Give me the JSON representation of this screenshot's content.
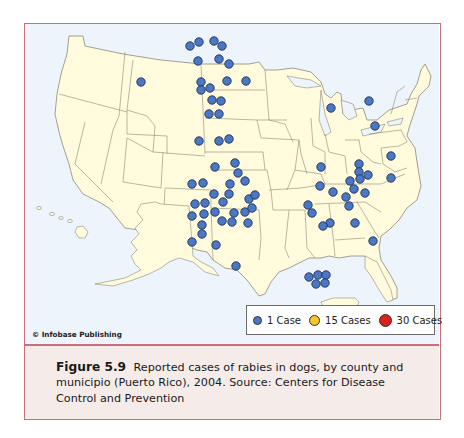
{
  "figure": {
    "label": "Figure 5.9",
    "caption": "Reported cases of rabies in dogs, by county and municipio (Puerto Rico), 2004. Source: Centers for Disease Control and Prevention"
  },
  "copyright": "© Infobase Publishing",
  "colors": {
    "frame": "#c9707a",
    "water": "#eef4fb",
    "land": "#fffbdc",
    "border": "#8a8a7a",
    "case_1": "#4a78c4",
    "case_15": "#f2c531",
    "case_30": "#d8231c",
    "caption_bg": "#f5ecea"
  },
  "legend": {
    "items": [
      {
        "label": "1 Case",
        "color": "#4a78c4",
        "size": "small"
      },
      {
        "label": "15 Cases",
        "color": "#f2c531",
        "size": "medium"
      },
      {
        "label": "30 Cases",
        "color": "#d8231c",
        "size": "large"
      }
    ]
  },
  "map": {
    "title": "Reported cases of rabies in dogs, 2004",
    "region": "United States incl. Alaska, Hawaii, Puerto Rico",
    "cases": [
      {
        "x": 189,
        "y": 45
      },
      {
        "x": 198,
        "y": 41
      },
      {
        "x": 213,
        "y": 40
      },
      {
        "x": 221,
        "y": 45
      },
      {
        "x": 197,
        "y": 60
      },
      {
        "x": 218,
        "y": 58
      },
      {
        "x": 228,
        "y": 63
      },
      {
        "x": 140,
        "y": 81
      },
      {
        "x": 200,
        "y": 81
      },
      {
        "x": 200,
        "y": 89
      },
      {
        "x": 209,
        "y": 87
      },
      {
        "x": 226,
        "y": 80
      },
      {
        "x": 245,
        "y": 80
      },
      {
        "x": 211,
        "y": 99
      },
      {
        "x": 220,
        "y": 100
      },
      {
        "x": 208,
        "y": 113
      },
      {
        "x": 218,
        "y": 113
      },
      {
        "x": 228,
        "y": 138
      },
      {
        "x": 198,
        "y": 140
      },
      {
        "x": 218,
        "y": 140
      },
      {
        "x": 234,
        "y": 162
      },
      {
        "x": 237,
        "y": 172
      },
      {
        "x": 214,
        "y": 166
      },
      {
        "x": 229,
        "y": 183
      },
      {
        "x": 228,
        "y": 193
      },
      {
        "x": 191,
        "y": 183
      },
      {
        "x": 202,
        "y": 182
      },
      {
        "x": 244,
        "y": 180
      },
      {
        "x": 213,
        "y": 193
      },
      {
        "x": 222,
        "y": 201
      },
      {
        "x": 248,
        "y": 198
      },
      {
        "x": 244,
        "y": 211
      },
      {
        "x": 233,
        "y": 212
      },
      {
        "x": 251,
        "y": 207
      },
      {
        "x": 194,
        "y": 203
      },
      {
        "x": 204,
        "y": 202
      },
      {
        "x": 203,
        "y": 213
      },
      {
        "x": 214,
        "y": 211
      },
      {
        "x": 191,
        "y": 215
      },
      {
        "x": 221,
        "y": 220
      },
      {
        "x": 231,
        "y": 221
      },
      {
        "x": 247,
        "y": 222
      },
      {
        "x": 201,
        "y": 224
      },
      {
        "x": 201,
        "y": 233
      },
      {
        "x": 191,
        "y": 241
      },
      {
        "x": 215,
        "y": 244
      },
      {
        "x": 235,
        "y": 265
      },
      {
        "x": 254,
        "y": 194
      },
      {
        "x": 330,
        "y": 107
      },
      {
        "x": 368,
        "y": 100
      },
      {
        "x": 374,
        "y": 125
      },
      {
        "x": 320,
        "y": 166
      },
      {
        "x": 358,
        "y": 163
      },
      {
        "x": 358,
        "y": 171
      },
      {
        "x": 367,
        "y": 174
      },
      {
        "x": 390,
        "y": 155
      },
      {
        "x": 359,
        "y": 178
      },
      {
        "x": 349,
        "y": 180
      },
      {
        "x": 353,
        "y": 188
      },
      {
        "x": 364,
        "y": 192
      },
      {
        "x": 390,
        "y": 177
      },
      {
        "x": 319,
        "y": 185
      },
      {
        "x": 332,
        "y": 191
      },
      {
        "x": 345,
        "y": 196
      },
      {
        "x": 348,
        "y": 205
      },
      {
        "x": 329,
        "y": 222
      },
      {
        "x": 322,
        "y": 225
      },
      {
        "x": 354,
        "y": 222
      },
      {
        "x": 372,
        "y": 240
      },
      {
        "x": 307,
        "y": 204
      },
      {
        "x": 311,
        "y": 212
      },
      {
        "x": 308,
        "y": 276
      },
      {
        "x": 317,
        "y": 274
      },
      {
        "x": 325,
        "y": 274
      },
      {
        "x": 315,
        "y": 283
      },
      {
        "x": 324,
        "y": 282
      }
    ]
  }
}
